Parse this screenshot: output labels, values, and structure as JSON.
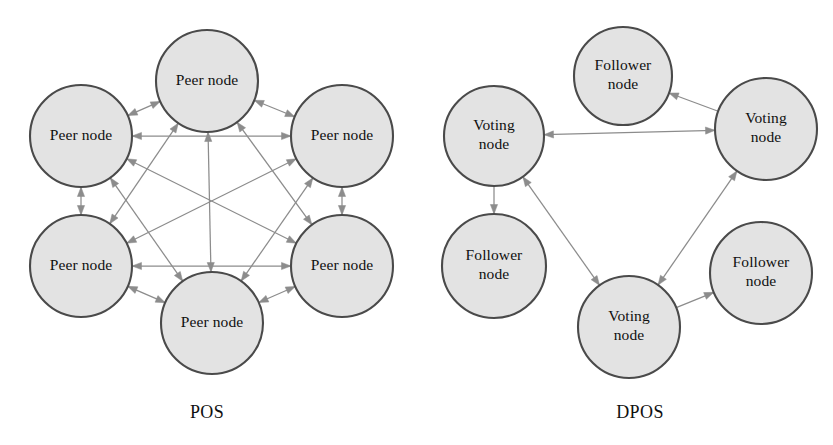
{
  "figure": {
    "background": "#ffffff",
    "width": 833,
    "height": 445,
    "node_fill": "#e3e3e3",
    "node_stroke": "#4a4a4a",
    "edge_color": "#8c8c8c",
    "text_color": "#101010"
  },
  "panels": [
    {
      "id": "pos",
      "caption": "POS",
      "caption_pos": {
        "x": 207,
        "y": 418
      },
      "node_radius": 51,
      "nodes": [
        {
          "id": "pos-n1",
          "label": "Peer node",
          "lines": [
            "Peer node"
          ],
          "cx": 207,
          "cy": 81
        },
        {
          "id": "pos-n2",
          "label": "Peer node",
          "lines": [
            "Peer node"
          ],
          "cx": 342,
          "cy": 136
        },
        {
          "id": "pos-n3",
          "label": "Peer node",
          "lines": [
            "Peer node"
          ],
          "cx": 342,
          "cy": 266
        },
        {
          "id": "pos-n4",
          "label": "Peer node",
          "lines": [
            "Peer node"
          ],
          "cx": 212,
          "cy": 323
        },
        {
          "id": "pos-n5",
          "label": "Peer node",
          "lines": [
            "Peer node"
          ],
          "cx": 81,
          "cy": 266
        },
        {
          "id": "pos-n6",
          "label": "Peer node",
          "lines": [
            "Peer node"
          ],
          "cx": 81,
          "cy": 136
        }
      ],
      "edges": [
        {
          "from": "pos-n1",
          "to": "pos-n2",
          "direction": "both"
        },
        {
          "from": "pos-n1",
          "to": "pos-n3",
          "direction": "both"
        },
        {
          "from": "pos-n1",
          "to": "pos-n4",
          "direction": "both"
        },
        {
          "from": "pos-n1",
          "to": "pos-n5",
          "direction": "both"
        },
        {
          "from": "pos-n1",
          "to": "pos-n6",
          "direction": "both"
        },
        {
          "from": "pos-n2",
          "to": "pos-n3",
          "direction": "both"
        },
        {
          "from": "pos-n2",
          "to": "pos-n4",
          "direction": "both"
        },
        {
          "from": "pos-n2",
          "to": "pos-n5",
          "direction": "both"
        },
        {
          "from": "pos-n2",
          "to": "pos-n6",
          "direction": "both"
        },
        {
          "from": "pos-n3",
          "to": "pos-n4",
          "direction": "both"
        },
        {
          "from": "pos-n3",
          "to": "pos-n5",
          "direction": "both"
        },
        {
          "from": "pos-n3",
          "to": "pos-n6",
          "direction": "both"
        },
        {
          "from": "pos-n4",
          "to": "pos-n5",
          "direction": "both"
        },
        {
          "from": "pos-n4",
          "to": "pos-n6",
          "direction": "both"
        },
        {
          "from": "pos-n5",
          "to": "pos-n6",
          "direction": "both"
        }
      ]
    },
    {
      "id": "dpos",
      "caption": "DPOS",
      "caption_pos": {
        "x": 640,
        "y": 418
      },
      "node_radius": 51,
      "nodes": [
        {
          "id": "dpos-f-top",
          "label": "Follower node",
          "lines": [
            "Follower",
            "node"
          ],
          "cx": 623,
          "cy": 76,
          "r": 49
        },
        {
          "id": "dpos-v-left",
          "label": "Voting node",
          "lines": [
            "Voting",
            "node"
          ],
          "cx": 494,
          "cy": 136,
          "r": 50
        },
        {
          "id": "dpos-v-right",
          "label": "Voting node",
          "lines": [
            "Voting",
            "node"
          ],
          "cx": 766,
          "cy": 129,
          "r": 51
        },
        {
          "id": "dpos-f-left",
          "label": "Follower node",
          "lines": [
            "Follower",
            "node"
          ],
          "cx": 494,
          "cy": 266,
          "r": 52
        },
        {
          "id": "dpos-f-right",
          "label": "Follower node",
          "lines": [
            "Follower",
            "node"
          ],
          "cx": 761,
          "cy": 273,
          "r": 51
        },
        {
          "id": "dpos-v-bottom",
          "label": "Voting node",
          "lines": [
            "Voting",
            "node"
          ],
          "cx": 629,
          "cy": 327,
          "r": 51
        }
      ],
      "edges": [
        {
          "from": "dpos-v-left",
          "to": "dpos-v-right",
          "direction": "both"
        },
        {
          "from": "dpos-v-left",
          "to": "dpos-v-bottom",
          "direction": "both"
        },
        {
          "from": "dpos-v-right",
          "to": "dpos-v-bottom",
          "direction": "both"
        },
        {
          "from": "dpos-v-right",
          "to": "dpos-f-top",
          "direction": "forward"
        },
        {
          "from": "dpos-v-left",
          "to": "dpos-f-left",
          "direction": "forward"
        },
        {
          "from": "dpos-v-bottom",
          "to": "dpos-f-right",
          "direction": "forward"
        }
      ]
    }
  ]
}
